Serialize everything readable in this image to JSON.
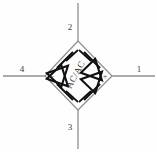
{
  "diagram": {
    "center_label": "AC/AC",
    "background_color": "#fefefe",
    "line_color": "#8a8a8a",
    "device_color": "#1a1a1a",
    "text_color": "#3b3b3b"
  },
  "terminals": [
    {
      "id": "terminal-1",
      "label": "1",
      "side": "right",
      "label_x": 139,
      "label_y": 72,
      "line_x1": 112,
      "line_y1": 76,
      "line_x2": 155,
      "line_y2": 76
    },
    {
      "id": "terminal-2",
      "label": "2",
      "side": "top",
      "label_x": 70,
      "label_y": 30,
      "line_x1": 78,
      "line_y1": 41,
      "line_x2": 78,
      "line_y2": 3
    },
    {
      "id": "terminal-3",
      "label": "3",
      "side": "bottom",
      "label_x": 70,
      "label_y": 130,
      "line_x1": 78,
      "line_y1": 110,
      "line_x2": 78,
      "line_y2": 149
    },
    {
      "id": "terminal-4",
      "label": "4",
      "side": "left",
      "label_x": 22,
      "label_y": 72,
      "line_x1": 45,
      "line_y1": 76,
      "line_x2": 3,
      "line_y2": 76
    }
  ],
  "polarity_marks": [
    {
      "id": "positive-mark",
      "label": "+",
      "x": 105,
      "y": 79
    },
    {
      "id": "negative-mark",
      "label": "−",
      "x": 52,
      "y": 79
    }
  ],
  "bridge": {
    "top_vertex": {
      "x": 78,
      "y": 41
    },
    "right_vertex": {
      "x": 112,
      "y": 76
    },
    "bottom_vertex": {
      "x": 78,
      "y": 110
    },
    "left_vertex": {
      "x": 45,
      "y": 76
    }
  },
  "thyristors": [
    {
      "id": "thyristor-upper-left",
      "quadrant": "upper-left",
      "label": "SCR1"
    },
    {
      "id": "thyristor-upper-right",
      "quadrant": "upper-right",
      "label": "SCR2"
    },
    {
      "id": "thyristor-lower-left",
      "quadrant": "lower-left",
      "label": "SCR3"
    },
    {
      "id": "thyristor-lower-right",
      "quadrant": "lower-right",
      "label": "SCR4"
    }
  ]
}
